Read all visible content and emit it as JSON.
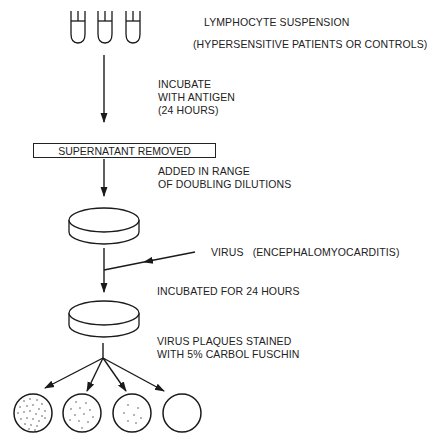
{
  "diagram": {
    "steps": {
      "lymphocyte_suspension": "LYMPHOCYTE SUSPENSION",
      "subjects": "(HYPERSENSITIVE PATIENTS OR CONTROLS)",
      "incubate_line1": "INCUBATE",
      "incubate_line2": "WITH ANTIGEN",
      "incubate_line3": "(24 HOURS)",
      "supernatant": "SUPERNATANT REMOVED",
      "added_line1": "ADDED IN RANGE",
      "added_line2": "OF DOUBLING DILUTIONS",
      "virus": "VIRUS   (ENCEPHALOMYOCARDITIS)",
      "incubated": "INCUBATED FOR 24 HOURS",
      "stained_line1": "VIRUS PLAQUES STAINED",
      "stained_line2": "WITH 5% CARBOL FUSCHIN"
    },
    "nodes": {
      "test_tubes": 3,
      "culture_dishes": 2,
      "result_plates": 4,
      "plate_plaque_density": [
        "high",
        "medium",
        "low",
        "none"
      ]
    },
    "colors": {
      "line": "#1a1a1a",
      "background": "#ffffff"
    }
  }
}
